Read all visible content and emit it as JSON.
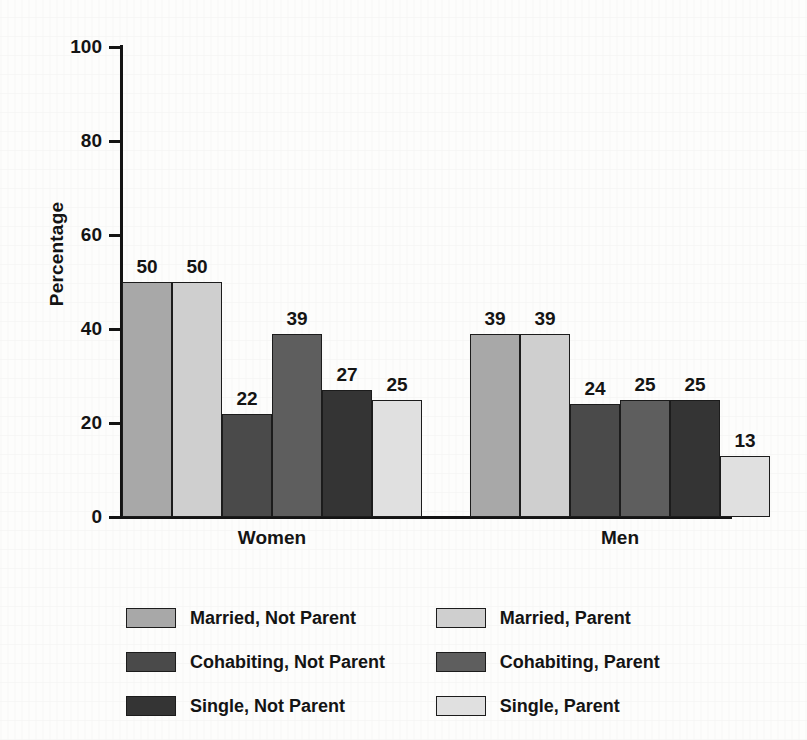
{
  "chart_data": {
    "type": "bar",
    "title": "",
    "xlabel": "",
    "ylabel": "Percentage",
    "ylim": [
      0,
      100
    ],
    "yticks": [
      0,
      20,
      40,
      60,
      80,
      100
    ],
    "grid": false,
    "legend_position": "bottom",
    "categories": [
      "Women",
      "Men"
    ],
    "series": [
      {
        "name": "Married, Not Parent",
        "color": "#a8a8a8",
        "values": [
          50,
          39
        ]
      },
      {
        "name": "Married, Parent",
        "color": "#cfcfcf",
        "values": [
          50,
          39
        ]
      },
      {
        "name": "Cohabiting, Not Parent",
        "color": "#4a4a4a",
        "values": [
          22,
          24
        ]
      },
      {
        "name": "Cohabiting, Parent",
        "color": "#5e5e5e",
        "values": [
          39,
          25
        ]
      },
      {
        "name": "Single, Not Parent",
        "color": "#343434",
        "values": [
          27,
          25
        ]
      },
      {
        "name": "Single, Parent",
        "color": "#e0e0e0",
        "values": [
          25,
          13
        ]
      }
    ]
  },
  "axis": {
    "y_title": "Percentage",
    "y_tick_labels": [
      "100",
      "80",
      "60",
      "40",
      "20",
      "0"
    ],
    "x_group_labels": [
      "Women",
      "Men"
    ]
  },
  "legend": {
    "rows": [
      {
        "left": {
          "label": "Married, Not Parent",
          "color": "#a8a8a8"
        },
        "right": {
          "label": "Married, Parent",
          "color": "#cfcfcf"
        }
      },
      {
        "left": {
          "label": "Cohabiting, Not Parent",
          "color": "#4a4a4a"
        },
        "right": {
          "label": "Cohabiting, Parent",
          "color": "#5e5e5e"
        }
      },
      {
        "left": {
          "label": "Single, Not Parent",
          "color": "#343434"
        },
        "right": {
          "label": "Single, Parent",
          "color": "#e0e0e0"
        }
      }
    ]
  },
  "bars": {
    "women": [
      {
        "label": "50",
        "value": 50,
        "color": "#a8a8a8",
        "series": "Married, Not Parent"
      },
      {
        "label": "50",
        "value": 50,
        "color": "#cfcfcf",
        "series": "Married, Parent"
      },
      {
        "label": "22",
        "value": 22,
        "color": "#4a4a4a",
        "series": "Cohabiting, Not Parent"
      },
      {
        "label": "39",
        "value": 39,
        "color": "#5e5e5e",
        "series": "Cohabiting, Parent"
      },
      {
        "label": "27",
        "value": 27,
        "color": "#343434",
        "series": "Single, Not Parent"
      },
      {
        "label": "25",
        "value": 25,
        "color": "#e0e0e0",
        "series": "Single, Parent"
      }
    ],
    "men": [
      {
        "label": "39",
        "value": 39,
        "color": "#a8a8a8",
        "series": "Married, Not Parent"
      },
      {
        "label": "39",
        "value": 39,
        "color": "#cfcfcf",
        "series": "Married, Parent"
      },
      {
        "label": "24",
        "value": 24,
        "color": "#4a4a4a",
        "series": "Cohabiting, Not Parent"
      },
      {
        "label": "25",
        "value": 25,
        "color": "#5e5e5e",
        "series": "Cohabiting, Parent"
      },
      {
        "label": "25",
        "value": 25,
        "color": "#343434",
        "series": "Single, Not Parent"
      },
      {
        "label": "13",
        "value": 13,
        "color": "#e0e0e0",
        "series": "Single, Parent"
      }
    ]
  }
}
